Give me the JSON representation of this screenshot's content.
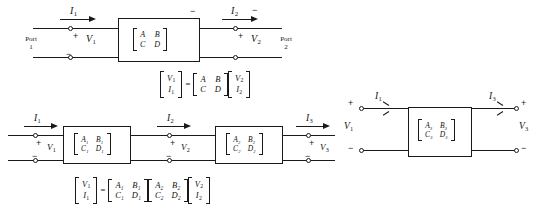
{
  "figure": {
    "stroke_color": "#1a1a1a",
    "background_color": "#ffffff"
  },
  "signs": {
    "plus": "+",
    "minus": "−",
    "equals": "="
  },
  "diagram_top": {
    "name": "single-two-port-network",
    "port_left_label_line1": "Port",
    "port_left_label_line2": "1",
    "port_right_label_line1": "Port",
    "port_right_label_line2": "2",
    "current_left": "I",
    "current_left_sub": "1",
    "current_right": "I",
    "current_right_sub": "2",
    "voltage_left": "V",
    "voltage_left_sub": "1",
    "voltage_right": "V",
    "voltage_right_sub": "2",
    "matrix": {
      "r0c0": "A",
      "r0c1": "B",
      "r1c0": "C",
      "r1c1": "D"
    }
  },
  "equation_top": {
    "name": "abcd-matrix-equation",
    "lhs": {
      "r0": "V",
      "r0_sub": "1",
      "r1": "I",
      "r1_sub": "1"
    },
    "matrix": {
      "r0c0": "A",
      "r0c1": "B",
      "r1c0": "C",
      "r1c1": "D"
    },
    "rhs": {
      "r0": "V",
      "r0_sub": "2",
      "r1": "I",
      "r1_sub": "2"
    }
  },
  "diagram_cascade": {
    "name": "cascaded-two-port-networks",
    "current_1": "I",
    "current_1_sub": "1",
    "current_2": "I",
    "current_2_sub": "2",
    "current_3": "I",
    "current_3_sub": "3",
    "voltage_1": "V",
    "voltage_1_sub": "1",
    "voltage_2": "V",
    "voltage_2_sub": "2",
    "voltage_3": "V",
    "voltage_3_sub": "3",
    "matrix_1": {
      "r0c0": "A₁",
      "r0c1": "B₁",
      "r1c0": "C₁",
      "r1c1": "D₁"
    },
    "matrix_2": {
      "r0c0": "A₂",
      "r0c1": "B₂",
      "r1c0": "C₂",
      "r1c1": "D₂"
    }
  },
  "equation_cascade": {
    "name": "cascade-matrix-equation",
    "lhs": {
      "r0": "V",
      "r0_sub": "1",
      "r1": "I",
      "r1_sub": "1"
    },
    "matrix_1": {
      "r0c0": "A₁",
      "r0c1": "B₁",
      "r1c0": "C₁",
      "r1c1": "D₁"
    },
    "matrix_2": {
      "r0c0": "A₂",
      "r0c1": "B₂",
      "r1c0": "C₂",
      "r1c1": "D₂"
    },
    "rhs": {
      "r0": "V",
      "r0_sub": "2",
      "r1": "I",
      "r1_sub": "2"
    }
  },
  "diagram_equivalent": {
    "name": "equivalent-two-port-network",
    "current_left": "I",
    "current_left_sub": "1",
    "current_right": "I",
    "current_right_sub": "3",
    "voltage_left": "V",
    "voltage_left_sub": "1",
    "voltage_right": "V",
    "voltage_right_sub": "3",
    "matrix": {
      "r0c0": "A₃",
      "r0c1": "B₃",
      "r1c0": "C₃",
      "r1c1": "D₃"
    }
  }
}
